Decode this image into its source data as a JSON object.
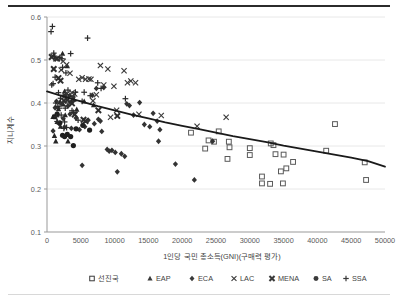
{
  "chart_data": {
    "type": "scatter",
    "title": "",
    "xlabel": "1인당 국민 총소득(GNI)(구매력 평가)",
    "ylabel": "지니계수",
    "xlim": [
      0,
      50000
    ],
    "ylim": [
      0.1,
      0.6
    ],
    "xticks": [
      0,
      5000,
      10000,
      15000,
      20000,
      25000,
      30000,
      35000,
      40000,
      45000,
      50000
    ],
    "xtick_labels": [
      "0",
      "5000",
      "10000",
      "15000",
      "20000",
      "25000",
      "30000",
      "35000",
      "40000",
      "45000",
      "50000"
    ],
    "yticks": [
      0.1,
      0.2,
      0.3,
      0.4,
      0.5,
      0.6
    ],
    "ytick_labels": [
      "0.1",
      "0.2",
      "0.3",
      "0.4",
      "0.5",
      "0.6"
    ],
    "grid": "horizontal",
    "legend_position": "bottom",
    "trendline": {
      "name": "추세선",
      "style": "solid",
      "color": "#1a1a1a",
      "width": 1.8,
      "points": [
        [
          0,
          0.427
        ],
        [
          2500,
          0.415
        ],
        [
          5000,
          0.404
        ],
        [
          7500,
          0.393
        ],
        [
          10000,
          0.383
        ],
        [
          12500,
          0.373
        ],
        [
          15000,
          0.364
        ],
        [
          17500,
          0.355
        ],
        [
          20000,
          0.347
        ],
        [
          22500,
          0.339
        ],
        [
          25000,
          0.331
        ],
        [
          27500,
          0.323
        ],
        [
          30000,
          0.316
        ],
        [
          32500,
          0.309
        ],
        [
          35000,
          0.301
        ],
        [
          37500,
          0.294
        ],
        [
          40000,
          0.287
        ],
        [
          42500,
          0.28
        ],
        [
          45000,
          0.273
        ],
        [
          47500,
          0.265
        ],
        [
          50000,
          0.252
        ]
      ]
    },
    "series": [
      {
        "name": "선진국",
        "marker": "square-open",
        "color": "#595959",
        "points": [
          [
            21300,
            0.331
          ],
          [
            23400,
            0.294
          ],
          [
            23900,
            0.313
          ],
          [
            24700,
            0.31
          ],
          [
            25400,
            0.334
          ],
          [
            26900,
            0.31
          ],
          [
            26700,
            0.27
          ],
          [
            27000,
            0.297
          ],
          [
            30000,
            0.295
          ],
          [
            30000,
            0.279
          ],
          [
            31800,
            0.229
          ],
          [
            31800,
            0.213
          ],
          [
            33000,
            0.212
          ],
          [
            33100,
            0.306
          ],
          [
            33500,
            0.302
          ],
          [
            33800,
            0.281
          ],
          [
            34600,
            0.241
          ],
          [
            34900,
            0.213
          ],
          [
            35000,
            0.28
          ],
          [
            35400,
            0.248
          ],
          [
            36400,
            0.263
          ],
          [
            41300,
            0.289
          ],
          [
            42600,
            0.351
          ],
          [
            47000,
            0.262
          ],
          [
            47200,
            0.221
          ]
        ]
      },
      {
        "name": "EAP",
        "marker": "triangle-filled",
        "color": "#262626",
        "points": [
          [
            900,
            0.368
          ],
          [
            1100,
            0.324
          ],
          [
            1300,
            0.311
          ],
          [
            1500,
            0.356
          ],
          [
            1700,
            0.386
          ],
          [
            1900,
            0.402
          ],
          [
            2000,
            0.345
          ],
          [
            2300,
            0.515
          ],
          [
            2400,
            0.397
          ],
          [
            2600,
            0.427
          ],
          [
            2700,
            0.372
          ],
          [
            3000,
            0.486
          ],
          [
            3100,
            0.311
          ],
          [
            3400,
            0.419
          ],
          [
            3600,
            0.404
          ],
          [
            4000,
            0.408
          ],
          [
            4400,
            0.385
          ],
          [
            5500,
            0.404
          ],
          [
            6900,
            0.395
          ]
        ]
      },
      {
        "name": "ECA",
        "marker": "diamond-filled",
        "color": "#333333",
        "points": [
          [
            900,
            0.335
          ],
          [
            1200,
            0.389
          ],
          [
            1400,
            0.404
          ],
          [
            1500,
            0.374
          ],
          [
            1800,
            0.352
          ],
          [
            2100,
            0.398
          ],
          [
            2400,
            0.364
          ],
          [
            2600,
            0.344
          ],
          [
            2800,
            0.419
          ],
          [
            3100,
            0.393
          ],
          [
            3400,
            0.374
          ],
          [
            3600,
            0.341
          ],
          [
            3900,
            0.414
          ],
          [
            4300,
            0.365
          ],
          [
            4800,
            0.338
          ],
          [
            5200,
            0.255
          ],
          [
            5600,
            0.345
          ],
          [
            6100,
            0.36
          ],
          [
            6700,
            0.418
          ],
          [
            7000,
            0.352
          ],
          [
            7300,
            0.434
          ],
          [
            7600,
            0.362
          ],
          [
            7900,
            0.358
          ],
          [
            8100,
            0.334
          ],
          [
            8400,
            0.436
          ],
          [
            8900,
            0.292
          ],
          [
            9200,
            0.288
          ],
          [
            9600,
            0.29
          ],
          [
            10100,
            0.285
          ],
          [
            10400,
            0.24
          ],
          [
            11000,
            0.282
          ],
          [
            11500,
            0.276
          ],
          [
            11800,
            0.398
          ],
          [
            12200,
            0.394
          ],
          [
            12800,
            0.372
          ],
          [
            13700,
            0.401
          ],
          [
            14400,
            0.35
          ],
          [
            15200,
            0.345
          ],
          [
            15700,
            0.376
          ],
          [
            16300,
            0.358
          ],
          [
            16500,
            0.311
          ],
          [
            16700,
            0.338
          ],
          [
            19000,
            0.258
          ],
          [
            21800,
            0.221
          ],
          [
            24500,
            0.311
          ]
        ]
      },
      {
        "name": "LAC",
        "marker": "x",
        "color": "#3a3a3a",
        "points": [
          [
            900,
            0.509
          ],
          [
            1300,
            0.503
          ],
          [
            2100,
            0.477
          ],
          [
            2400,
            0.497
          ],
          [
            2900,
            0.489
          ],
          [
            3000,
            0.422
          ],
          [
            3400,
            0.469
          ],
          [
            3700,
            0.424
          ],
          [
            4100,
            0.421
          ],
          [
            4700,
            0.455
          ],
          [
            5200,
            0.459
          ],
          [
            5700,
            0.455
          ],
          [
            6200,
            0.456
          ],
          [
            6500,
            0.455
          ],
          [
            6800,
            0.405
          ],
          [
            7300,
            0.419
          ],
          [
            7900,
            0.487
          ],
          [
            8400,
            0.442
          ],
          [
            9000,
            0.479
          ],
          [
            9400,
            0.367
          ],
          [
            9900,
            0.439
          ],
          [
            10300,
            0.383
          ],
          [
            11400,
            0.475
          ],
          [
            11900,
            0.447
          ],
          [
            12400,
            0.451
          ],
          [
            13100,
            0.447
          ],
          [
            13600,
            0.374
          ],
          [
            16900,
            0.371
          ],
          [
            22200,
            0.346
          ],
          [
            26500,
            0.367
          ]
        ]
      },
      {
        "name": "MENA",
        "marker": "x-bold",
        "color": "#2e2e2e",
        "points": [
          [
            700,
            0.507
          ],
          [
            1000,
            0.479
          ],
          [
            1500,
            0.503
          ],
          [
            1700,
            0.458
          ],
          [
            2000,
            0.452
          ],
          [
            2500,
            0.405
          ],
          [
            3000,
            0.407
          ],
          [
            3700,
            0.399
          ],
          [
            4100,
            0.373
          ],
          [
            5400,
            0.361
          ],
          [
            5700,
            0.358
          ],
          [
            7600,
            0.383
          ],
          [
            10400,
            0.37
          ]
        ]
      },
      {
        "name": "SA",
        "marker": "circle-filled",
        "color": "#1f1f1f",
        "points": [
          [
            1100,
            0.368
          ],
          [
            1500,
            0.374
          ],
          [
            1900,
            0.354
          ],
          [
            2300,
            0.325
          ],
          [
            2600,
            0.322
          ],
          [
            3000,
            0.327
          ],
          [
            3500,
            0.322
          ],
          [
            3900,
            0.301
          ],
          [
            4300,
            0.34
          ],
          [
            5300,
            0.348
          ],
          [
            6300,
            0.337
          ]
        ]
      },
      {
        "name": "SSA",
        "marker": "plus",
        "color": "#2b2b2b",
        "points": [
          [
            600,
            0.566
          ],
          [
            800,
            0.578
          ],
          [
            700,
            0.442
          ],
          [
            900,
            0.445
          ],
          [
            1000,
            0.516
          ],
          [
            1100,
            0.509
          ],
          [
            1200,
            0.46
          ],
          [
            1300,
            0.4
          ],
          [
            1400,
            0.368
          ],
          [
            1500,
            0.357
          ],
          [
            1600,
            0.392
          ],
          [
            1700,
            0.424
          ],
          [
            1800,
            0.388
          ],
          [
            1900,
            0.506
          ],
          [
            2000,
            0.411
          ],
          [
            2100,
            0.372
          ],
          [
            2200,
            0.503
          ],
          [
            2300,
            0.483
          ],
          [
            2400,
            0.418
          ],
          [
            2500,
            0.341
          ],
          [
            2600,
            0.356
          ],
          [
            2700,
            0.388
          ],
          [
            2800,
            0.47
          ],
          [
            2900,
            0.343
          ],
          [
            3100,
            0.43
          ],
          [
            3200,
            0.414
          ],
          [
            3400,
            0.4
          ],
          [
            3500,
            0.515
          ],
          [
            3700,
            0.382
          ],
          [
            3900,
            0.378
          ],
          [
            4200,
            0.425
          ],
          [
            4600,
            0.36
          ],
          [
            5200,
            0.404
          ],
          [
            5500,
            0.425
          ],
          [
            6000,
            0.551
          ],
          [
            6400,
            0.417
          ],
          [
            7500,
            0.447
          ],
          [
            8000,
            0.434
          ],
          [
            11600,
            0.41
          ]
        ]
      }
    ],
    "legend": [
      {
        "label": "선진국",
        "marker": "square-open"
      },
      {
        "label": "EAP",
        "marker": "triangle-filled"
      },
      {
        "label": "ECA",
        "marker": "diamond-filled"
      },
      {
        "label": "LAC",
        "marker": "x"
      },
      {
        "label": "MENA",
        "marker": "x-bold"
      },
      {
        "label": "SA",
        "marker": "circle-filled"
      },
      {
        "label": "SSA",
        "marker": "plus"
      }
    ]
  }
}
